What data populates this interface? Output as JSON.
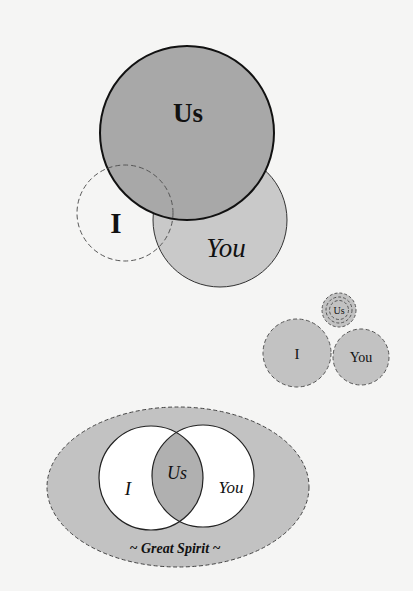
{
  "colors": {
    "background": "#f5f5f4",
    "dark_fill": "#a8a8a8",
    "medium_fill": "#c9c9c9",
    "light_fill": "#c2c2c2",
    "white_fill": "#ffffff",
    "stroke": "#1a1a1a",
    "dashed_stroke": "#555555",
    "text": "#111111"
  },
  "diagrams": [
    {
      "id": "overlap-us-dominant",
      "description": "Large solid 'Us' circle overlapping a dashed 'I' circle and a light 'You' circle",
      "labels": {
        "us": "Us",
        "i": "I",
        "you": "You"
      }
    },
    {
      "id": "separate-small",
      "description": "Small dashed 'I' and 'You' circles with a tiny concentric dashed 'Us' above",
      "labels": {
        "us": "Us",
        "i": "I",
        "you": "You"
      }
    },
    {
      "id": "great-spirit-venn",
      "description": "Venn diagram of 'I' and 'You' with 'Us' intersection inside dashed 'Great Spirit' ellipse",
      "labels": {
        "us": "Us",
        "i": "I",
        "you": "You",
        "container": "~ Great Spirit ~"
      }
    }
  ]
}
